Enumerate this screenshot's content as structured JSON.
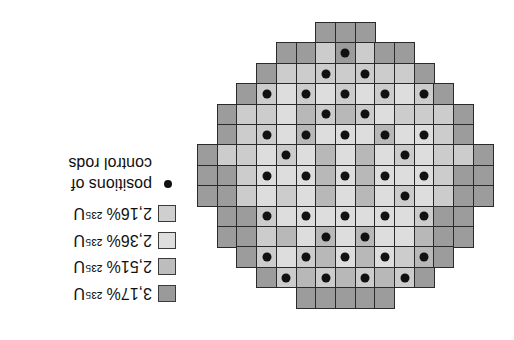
{
  "figure": {
    "orientation": "rotated-180",
    "cell_size": 19.7,
    "row_height": 20.4,
    "grid_origin": {
      "x": 197,
      "y": 22
    },
    "colors": {
      "D": "#9c9c9c",
      "M": "#b8b8b8",
      "L": "#cccccc",
      "X": "#dddddd"
    },
    "rows": [
      {
        "start": 6,
        "cells": "DDD",
        "dots": []
      },
      {
        "start": 4,
        "cells": "DDLDLDD",
        "dots": [
          7
        ]
      },
      {
        "start": 3,
        "cells": "DLLLLLLLD",
        "dots": [
          6,
          8
        ]
      },
      {
        "start": 2,
        "cells": "DLXLXLXLXLD",
        "dots": [
          3,
          5,
          7,
          9,
          11
        ]
      },
      {
        "start": 1,
        "cells": "DLLXMLMLXLLLD",
        "dots": [
          6,
          8
        ]
      },
      {
        "start": 1,
        "cells": "DLLXMXXXMXXLD",
        "dots": [
          3,
          5,
          7,
          9,
          11
        ]
      },
      {
        "start": 0,
        "cells": "DLLXLXMXMXLXLLD",
        "dots": [
          4,
          10
        ]
      },
      {
        "start": 0,
        "cells": "DDLXXXMXMXXXLDD",
        "dots": [
          3,
          5,
          7,
          9,
          11
        ]
      },
      {
        "start": 0,
        "cells": "DDLXLXMXMXLXLDD",
        "dots": [
          10
        ]
      },
      {
        "start": 1,
        "cells": "DDLXXXXXXXLDD",
        "dots": [
          3,
          5,
          7,
          9,
          11
        ]
      },
      {
        "start": 1,
        "cells": "DDLMXMXMXXMDD",
        "dots": [
          6,
          8
        ]
      },
      {
        "start": 2,
        "cells": "DLXLMXMXLMD",
        "dots": [
          3,
          5,
          7,
          9,
          11
        ]
      },
      {
        "start": 3,
        "cells": "DLMLMLMLD",
        "dots": [
          4,
          6,
          8,
          10
        ]
      },
      {
        "start": 5,
        "cells": "DDDDD",
        "dots": []
      }
    ]
  },
  "legend": {
    "items": [
      {
        "label": "2,16% ²³⁵U",
        "color": "#cfcfcf",
        "box": {
          "x": 158,
          "y": 205
        }
      },
      {
        "label": "2,36% ²³⁵U",
        "color": "#dedede",
        "box": {
          "x": 158,
          "y": 232
        }
      },
      {
        "label": "2,51% ²³⁵U",
        "color": "#bdbdbd",
        "box": {
          "x": 158,
          "y": 258
        }
      },
      {
        "label": "3,17% ²³⁵U",
        "color": "#9a9a9a",
        "box": {
          "x": 158,
          "y": 285
        }
      }
    ],
    "rods": {
      "line1": "positions of",
      "line2": "control rods",
      "dot": {
        "x": 162,
        "y": 183
      }
    }
  }
}
